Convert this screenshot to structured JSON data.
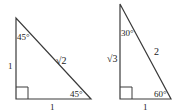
{
  "diagram": {
    "stroke_color": "#3a3a3a",
    "triangles": [
      {
        "name": "45-45-90",
        "vertices": {
          "top": [
            16,
            18
          ],
          "right_angle": [
            16,
            99
          ],
          "base_end": [
            91,
            99
          ]
        },
        "labels": {
          "top_angle": "45°",
          "hypotenuse": "√2",
          "vertical_leg": "1",
          "bottom_angle": "45°",
          "base": "1"
        }
      },
      {
        "name": "30-60-90",
        "vertices": {
          "top": [
            120,
            4
          ],
          "right_angle": [
            120,
            99
          ],
          "base_end": [
            171,
            99
          ]
        },
        "labels": {
          "top_angle": "30°",
          "hypotenuse": "2",
          "vertical_leg": "√3",
          "bottom_angle": "60°",
          "base": "1"
        }
      }
    ]
  }
}
